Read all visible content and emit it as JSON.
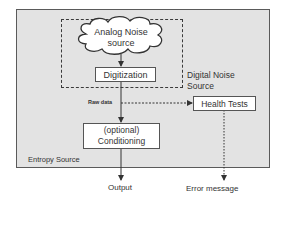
{
  "diagram": {
    "container_label": "Entropy Source",
    "digital_noise_source_label_line1": "Digital Noise",
    "digital_noise_source_label_line2": "Source",
    "nodes": {
      "analog_noise_line1": "Analog Noise",
      "analog_noise_line2": "source",
      "digitization": "Digitization",
      "health_tests": "Health Tests",
      "conditioning_line1": "(optional)",
      "conditioning_line2": "Conditioning"
    },
    "edge_labels": {
      "raw_data": "Raw data"
    },
    "outputs": {
      "output": "Output",
      "error_message": "Error message"
    },
    "colors": {
      "container_fill": "#e3e3e3",
      "box_fill": "#ffffff",
      "line": "#333333"
    }
  }
}
